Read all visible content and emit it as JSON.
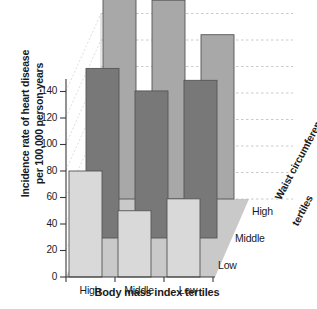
{
  "chart_data": {
    "type": "bar",
    "title": "",
    "subtitle": "",
    "xlabel": "Body mass index tertiles",
    "ylabel": "Incidence rate of heart disease per 100,000 person-years",
    "ylabel_line1": "Incidence rate of heart disease",
    "ylabel_line2": "per 100,000 person-years",
    "zlabel": "Waist circumference tertiles",
    "zlabel_line1": "Waist circumference",
    "zlabel_line2": "tertiles",
    "categories": [
      "High",
      "Middle",
      "Low"
    ],
    "depth_categories": [
      "Low",
      "Middle",
      "High"
    ],
    "ylim": [
      0,
      160
    ],
    "yticks": [
      0,
      20,
      40,
      60,
      80,
      100,
      120,
      140
    ],
    "ytick_labels": [
      "0",
      "20",
      "40",
      "60",
      "80",
      "100",
      "120",
      "140"
    ],
    "grid": "back-wall dashed horizontal",
    "legend": "depth axis labels at right",
    "projection": "3d",
    "series": [
      {
        "name": "Low",
        "depth_index": 0,
        "color": "#d9d9d9",
        "values": [
          80,
          50,
          59
        ]
      },
      {
        "name": "Middle",
        "depth_index": 1,
        "color": "#787878",
        "values": [
          128,
          111,
          119
        ]
      },
      {
        "name": "High",
        "depth_index": 2,
        "color": "#a8a8a8",
        "values": [
          158,
          150,
          124
        ]
      }
    ]
  },
  "axes": {
    "y_ticks": [
      "140",
      "120",
      "100",
      "80",
      "60",
      "40",
      "20",
      "0"
    ],
    "x_ticks": [
      "High",
      "Middle",
      "Low"
    ],
    "z_ticks": [
      "High",
      "Middle",
      "Low"
    ]
  },
  "colors": {
    "front_row": "#d9d9d9",
    "middle_row": "#787878",
    "back_row": "#a8a8a8",
    "floor": "#c9c9c9",
    "outline": "#555555",
    "grid": "#bdbdbd",
    "axis": "#3a3a3a",
    "text": "#1a1a1a"
  }
}
